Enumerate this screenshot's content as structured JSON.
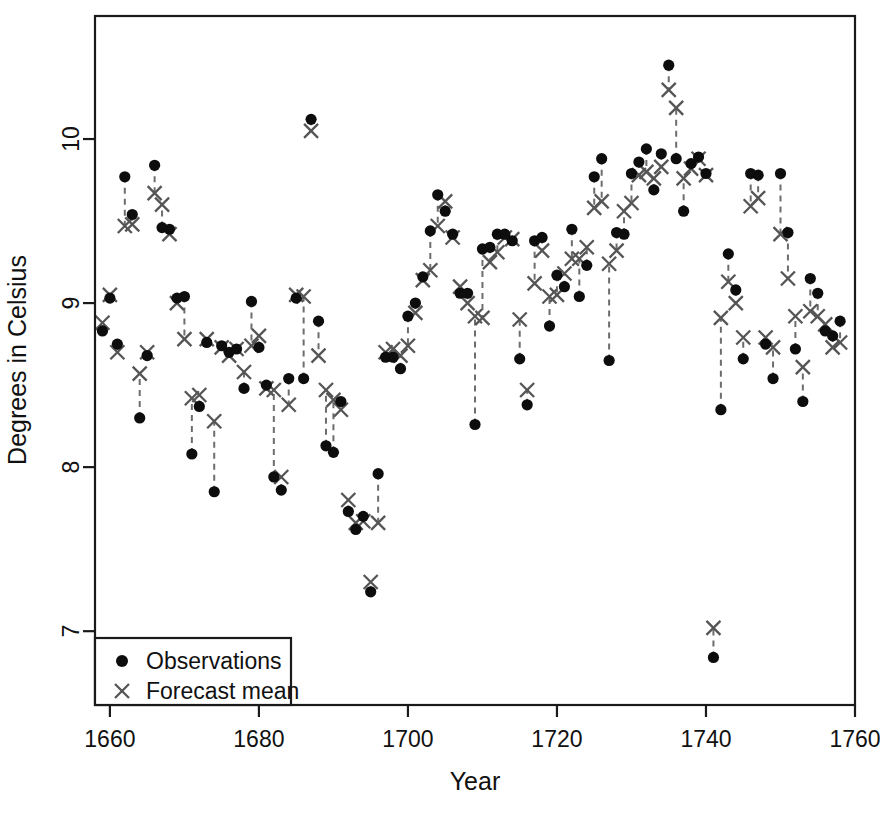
{
  "chart_data": {
    "type": "scatter",
    "title": "",
    "xlabel": "Year",
    "ylabel": "Degrees in Celsius",
    "xlim": [
      1658,
      1760
    ],
    "ylim": [
      6.55,
      10.75
    ],
    "xticks": [
      1660,
      1680,
      1700,
      1720,
      1740,
      1760
    ],
    "yticks": [
      7,
      8,
      9,
      10
    ],
    "xticklabels": [
      "1660",
      "1680",
      "1700",
      "1720",
      "1740",
      "1760"
    ],
    "yticklabels": [
      "7",
      "8",
      "9",
      "10"
    ],
    "grid": false,
    "legend_position": "bottom-left",
    "legend_entries": [
      {
        "label": "Observations",
        "marker": "filled-circle",
        "color": "#0d0d0d"
      },
      {
        "label": "Forecast mean",
        "marker": "cross-x",
        "color": "#555555"
      }
    ],
    "x": [
      1659,
      1660,
      1661,
      1662,
      1663,
      1664,
      1665,
      1666,
      1667,
      1668,
      1669,
      1670,
      1671,
      1672,
      1673,
      1674,
      1675,
      1676,
      1677,
      1678,
      1679,
      1680,
      1681,
      1682,
      1683,
      1684,
      1685,
      1686,
      1687,
      1688,
      1689,
      1690,
      1691,
      1692,
      1693,
      1694,
      1695,
      1696,
      1697,
      1698,
      1699,
      1700,
      1701,
      1702,
      1703,
      1704,
      1705,
      1706,
      1707,
      1708,
      1709,
      1710,
      1711,
      1712,
      1713,
      1714,
      1715,
      1716,
      1717,
      1718,
      1719,
      1720,
      1721,
      1722,
      1723,
      1724,
      1725,
      1726,
      1727,
      1728,
      1729,
      1730,
      1731,
      1732,
      1733,
      1734,
      1735,
      1736,
      1737,
      1738,
      1739,
      1740,
      1741,
      1742,
      1743,
      1744,
      1745,
      1746,
      1747,
      1748,
      1749,
      1750,
      1751,
      1752,
      1753,
      1754,
      1755,
      1756,
      1757,
      1758
    ],
    "series": [
      {
        "name": "Observations",
        "marker": "filled-circle",
        "color": "#0d0d0d",
        "values": [
          8.83,
          9.03,
          8.75,
          9.77,
          9.54,
          8.3,
          8.68,
          9.84,
          9.46,
          9.45,
          9.03,
          9.04,
          8.08,
          8.37,
          8.76,
          7.85,
          8.74,
          8.7,
          8.72,
          8.48,
          9.01,
          8.73,
          8.5,
          7.94,
          7.86,
          8.54,
          9.03,
          8.54,
          10.12,
          8.89,
          8.13,
          8.09,
          8.4,
          7.73,
          7.62,
          7.7,
          7.24,
          7.96,
          8.67,
          8.67,
          8.6,
          8.92,
          9.0,
          9.16,
          9.44,
          9.66,
          9.56,
          9.42,
          9.06,
          9.06,
          8.26,
          9.33,
          9.34,
          9.42,
          9.42,
          9.38,
          8.66,
          8.38,
          9.38,
          9.4,
          8.86,
          9.17,
          9.1,
          9.45,
          9.04,
          9.23,
          9.77,
          9.88,
          8.65,
          9.43,
          9.42,
          9.79,
          9.86,
          9.94,
          9.69,
          9.91,
          10.45,
          9.88,
          9.56,
          9.85,
          9.89,
          9.79,
          6.84,
          8.35,
          9.3,
          9.08,
          8.66,
          9.79,
          9.78,
          8.75,
          8.54,
          9.79,
          9.43,
          8.72,
          8.4,
          9.15,
          9.06,
          8.83,
          8.8,
          8.89
        ]
      },
      {
        "name": "Forecast mean",
        "marker": "cross-x",
        "color": "#555555",
        "values": [
          8.88,
          9.05,
          8.7,
          9.47,
          9.48,
          8.57,
          8.7,
          9.67,
          9.6,
          9.42,
          9.0,
          8.78,
          8.42,
          8.44,
          8.78,
          8.28,
          8.73,
          8.68,
          8.72,
          8.58,
          8.74,
          8.8,
          8.48,
          8.47,
          7.94,
          8.38,
          9.05,
          9.04,
          10.05,
          8.68,
          8.47,
          8.41,
          8.35,
          7.8,
          7.66,
          7.67,
          7.3,
          7.66,
          8.7,
          8.72,
          8.68,
          8.74,
          8.94,
          9.14,
          9.2,
          9.47,
          9.62,
          9.4,
          9.1,
          9.0,
          8.92,
          8.91,
          9.25,
          9.31,
          9.4,
          9.39,
          8.9,
          8.47,
          9.12,
          9.32,
          9.04,
          9.05,
          9.18,
          9.27,
          9.27,
          9.34,
          9.58,
          9.62,
          9.24,
          9.32,
          9.56,
          9.61,
          9.78,
          9.8,
          9.76,
          9.83,
          10.3,
          10.19,
          9.76,
          9.82,
          9.88,
          9.78,
          7.02,
          8.91,
          9.13,
          9.0,
          8.79,
          9.59,
          9.64,
          8.79,
          8.73,
          9.42,
          9.15,
          8.92,
          8.61,
          8.95,
          8.92,
          8.87,
          8.73,
          8.76
        ]
      }
    ]
  }
}
